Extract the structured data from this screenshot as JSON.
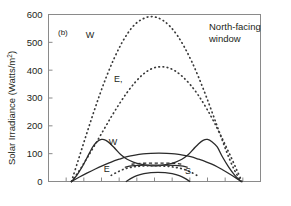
{
  "figure": {
    "panel_label": "(b)",
    "annotation": "North-facing window",
    "annotation_line1": "North-facing",
    "annotation_line2": "window"
  },
  "chart_data": {
    "type": "line",
    "title": "",
    "subtitle": "",
    "panel": "(b)",
    "annotation": "North-facing window",
    "xlabel": "",
    "ylabel": "Solar Irradiance (Watts/m²)",
    "ylabel_text": "Solar Irradiance (Watts/m",
    "ylabel_sup": "2",
    "ylabel_close": ")",
    "ylim": [
      0,
      600
    ],
    "xlim": [
      0,
      12
    ],
    "yticks": [
      0,
      100,
      200,
      300,
      400,
      500,
      600
    ],
    "ytick_labels": [
      "0",
      "100",
      "200",
      "300",
      "400",
      "500",
      "600"
    ],
    "xticks": [
      0,
      1,
      2,
      3,
      4,
      5,
      6,
      7,
      8,
      9,
      10,
      11,
      12
    ],
    "xtick_labels": [
      "",
      "",
      "",
      "",
      "",
      "",
      "",
      "",
      "",
      "",
      "",
      "",
      ""
    ],
    "grid": false,
    "legend": "inline-curve-labels",
    "legend_position": "on-curves",
    "accent_color": "#2b2b2b",
    "series": [
      {
        "name": "W (unshaded, dotted)",
        "label": "W",
        "style": "dotted",
        "label_x": 2.35,
        "label_y": 515,
        "x": [
          1.3,
          1.7,
          2.1,
          2.5,
          2.9,
          3.3,
          3.7,
          4.1,
          4.5,
          4.9,
          5.3,
          5.7,
          6.1,
          6.5,
          6.9,
          7.3,
          7.7,
          8.1,
          8.5,
          8.9,
          9.3,
          9.7,
          10.1,
          10.5,
          10.9
        ],
        "y": [
          0,
          80,
          160,
          238,
          312,
          380,
          440,
          492,
          534,
          565,
          583,
          592,
          590,
          578,
          556,
          524,
          482,
          432,
          374,
          310,
          242,
          172,
          104,
          44,
          0
        ]
      },
      {
        "name": "E (shaded sky, dotted)",
        "label": "E,",
        "style": "dotted",
        "label_x": 3.95,
        "label_y": 356,
        "x": [
          1.3,
          1.75,
          2.2,
          2.65,
          3.1,
          3.55,
          4.0,
          4.45,
          4.9,
          5.35,
          5.8,
          6.25,
          6.7,
          7.15,
          7.6,
          8.05,
          8.5,
          8.95,
          9.4,
          9.85,
          10.3,
          10.75,
          10.95
        ],
        "y": [
          0,
          40,
          86,
          134,
          183,
          232,
          278,
          320,
          356,
          385,
          404,
          412,
          410,
          398,
          376,
          346,
          308,
          262,
          210,
          152,
          92,
          28,
          0
        ]
      },
      {
        "name": "W (solid, twin-peaked)",
        "label": "W",
        "style": "solid",
        "label_x": 3.65,
        "label_y": 131,
        "x": [
          1.3,
          1.6,
          1.9,
          2.2,
          2.5,
          2.75,
          3.0,
          3.25,
          3.5,
          3.8,
          4.1,
          4.45,
          4.8,
          5.2,
          5.6,
          6.0,
          6.4,
          6.8,
          7.2,
          7.55,
          7.9,
          8.2,
          8.5,
          8.75,
          9.0,
          9.25,
          9.55,
          9.85,
          10.2,
          10.55,
          10.9
        ],
        "y": [
          0,
          22,
          52,
          88,
          124,
          143,
          151,
          148,
          136,
          116,
          96,
          80,
          70,
          62,
          58,
          56,
          58,
          62,
          70,
          80,
          96,
          116,
          136,
          148,
          151,
          143,
          124,
          88,
          52,
          22,
          0
        ]
      },
      {
        "name": "E (solid, broad plateau)",
        "label": "E",
        "style": "solid",
        "label_x": 3.3,
        "label_y": 33,
        "x": [
          1.3,
          1.75,
          2.2,
          2.65,
          3.1,
          3.55,
          4.0,
          4.45,
          4.9,
          5.35,
          5.8,
          6.25,
          6.7,
          7.15,
          7.6,
          8.05,
          8.5,
          8.95,
          9.4,
          9.85,
          10.3,
          10.6,
          10.9
        ],
        "y": [
          0,
          16,
          31,
          45,
          58,
          70,
          80,
          89,
          95,
          99,
          101,
          102,
          101,
          99,
          95,
          89,
          80,
          70,
          58,
          42,
          25,
          13,
          0
        ]
      },
      {
        "name": "S (solid, low dome)",
        "label": "S",
        "style": "solid",
        "label_x": 7.9,
        "label_y": 26,
        "x": [
          4.4,
          4.7,
          5.0,
          5.4,
          5.8,
          6.2,
          6.6,
          7.0,
          7.4,
          7.7,
          8.0
        ],
        "y": [
          0,
          12,
          21,
          28,
          32,
          33,
          32,
          28,
          21,
          12,
          0
        ]
      },
      {
        "name": "S (solid, mid plateau)",
        "label": "",
        "style": "solid",
        "label_x": null,
        "label_y": null,
        "x": [
          4.35,
          4.7,
          5.1,
          5.6,
          6.1,
          6.6,
          7.1,
          7.5,
          7.85
        ],
        "y": [
          52,
          56,
          58,
          59,
          59,
          59,
          58,
          56,
          52
        ]
      },
      {
        "name": "S (shaded, dashed mid segment)",
        "label": "",
        "style": "dashed",
        "label_x": null,
        "label_y": null,
        "x": [
          4.7,
          5.2,
          5.7,
          6.2,
          6.7,
          7.2,
          7.6
        ],
        "y": [
          62,
          65,
          66,
          66,
          66,
          65,
          62
        ]
      },
      {
        "name": "S (shaded sky, dotted low)",
        "label": "",
        "style": "dotted",
        "label_x": null,
        "label_y": null,
        "x": [
          3.55,
          3.9,
          4.25,
          4.6,
          5.0,
          5.45,
          5.9,
          6.35,
          6.8,
          7.25,
          7.65,
          8.05,
          8.4
        ],
        "y": [
          22,
          34,
          44,
          50,
          54,
          56,
          57,
          56,
          54,
          50,
          44,
          34,
          22
        ]
      }
    ]
  }
}
